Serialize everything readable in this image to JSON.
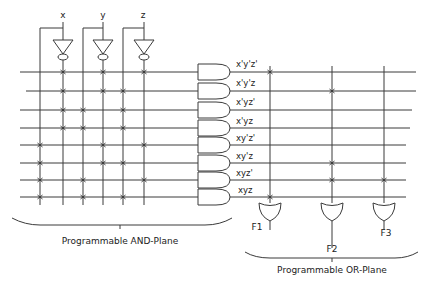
{
  "inputs": [
    {
      "name": "x",
      "true_line": "x",
      "complement_line": "x'"
    },
    {
      "name": "y",
      "true_line": "y",
      "complement_line": "y'"
    },
    {
      "name": "z",
      "true_line": "z",
      "complement_line": "z'"
    }
  ],
  "and_plane": {
    "caption": "Programmable AND-Plane",
    "literal_columns": [
      "x",
      "x'",
      "y",
      "y'",
      "z",
      "z'"
    ],
    "product_terms": [
      {
        "label": "x'y'z'",
        "connections": [
          "x'",
          "y'",
          "z'"
        ]
      },
      {
        "label": "x'y'z",
        "connections": [
          "x'",
          "y'",
          "z"
        ]
      },
      {
        "label": "x'yz'",
        "connections": [
          "x'",
          "y",
          "z"
        ]
      },
      {
        "label": "x'yz",
        "connections": [
          "x'",
          "y",
          "z"
        ]
      },
      {
        "label": "xy'z'",
        "connections": [
          "x",
          "y'",
          "z'"
        ]
      },
      {
        "label": "xy'z",
        "connections": [
          "x",
          "y'",
          "z"
        ]
      },
      {
        "label": "xyz'",
        "connections": [
          "x",
          "y",
          "z'"
        ]
      },
      {
        "label": "xyz",
        "connections": [
          "x",
          "y",
          "z"
        ]
      }
    ]
  },
  "or_plane": {
    "caption": "Programmable OR-Plane",
    "outputs": [
      {
        "label": "F1",
        "terms": [
          "x'y'z'",
          "xyz"
        ]
      },
      {
        "label": "F2",
        "terms": [
          "x'y'z",
          "xy'z",
          "xyz'"
        ]
      },
      {
        "label": "F3",
        "terms": [
          "xyz'"
        ]
      }
    ]
  }
}
